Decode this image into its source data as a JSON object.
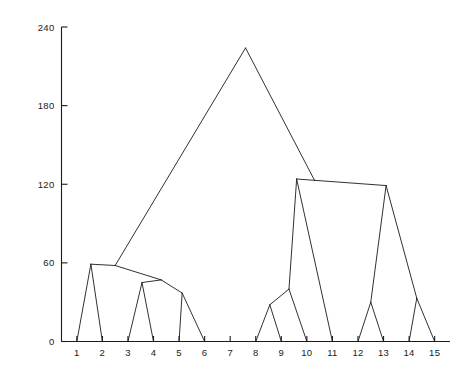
{
  "chart_data": {
    "type": "line",
    "title": "",
    "xlabel": "",
    "ylabel": "",
    "grid": false,
    "legend": "none",
    "plot_kind": "dendrogram",
    "orientation": "vertical-leaves-at-bottom",
    "xlim": [
      0.4,
      15.6
    ],
    "ylim": [
      0,
      240
    ],
    "y_ticks": [
      0,
      60,
      120,
      180,
      240
    ],
    "y_tick_labels": [
      "0",
      "60",
      "120",
      "180",
      "240"
    ],
    "x_ticks": [
      1,
      2,
      3,
      4,
      5,
      6,
      7,
      8,
      9,
      10,
      11,
      12,
      13,
      14,
      15
    ],
    "x_tick_labels": [
      "1",
      "2",
      "3",
      "4",
      "5",
      "6",
      "7",
      "8",
      "9",
      "10",
      "11",
      "12",
      "13",
      "14",
      "15"
    ],
    "leaves": [
      {
        "label": "1",
        "x": 1
      },
      {
        "label": "2",
        "x": 2
      },
      {
        "label": "3",
        "x": 3
      },
      {
        "label": "4",
        "x": 4
      },
      {
        "label": "5",
        "x": 5
      },
      {
        "label": "6",
        "x": 6
      },
      {
        "label": "7",
        "x": 7
      },
      {
        "label": "8",
        "x": 8
      },
      {
        "label": "9",
        "x": 9
      },
      {
        "label": "10",
        "x": 10
      },
      {
        "label": "11",
        "x": 11
      },
      {
        "label": "12",
        "x": 12
      },
      {
        "label": "13",
        "x": 13
      },
      {
        "label": "14",
        "x": 14
      },
      {
        "label": "15",
        "x": 15
      }
    ],
    "merges": [
      {
        "id": "n12",
        "x": 1.55,
        "height": 59,
        "children": [
          "1",
          "2"
        ]
      },
      {
        "id": "n34",
        "x": 3.55,
        "height": 45,
        "children": [
          "3",
          "4"
        ]
      },
      {
        "id": "n56",
        "x": 5.12,
        "height": 37,
        "children": [
          "5",
          "6"
        ]
      },
      {
        "id": "n3456",
        "x": 4.3,
        "height": 47,
        "children": [
          "n34",
          "n56"
        ]
      },
      {
        "id": "nL",
        "x": 2.5,
        "height": 58,
        "children": [
          "n12",
          "n3456"
        ]
      },
      {
        "id": "n89",
        "x": 8.55,
        "height": 28,
        "children": [
          "8",
          "9"
        ]
      },
      {
        "id": "n8910",
        "x": 9.3,
        "height": 40,
        "children": [
          "n89",
          "10"
        ]
      },
      {
        "id": "n1213",
        "x": 12.5,
        "height": 30,
        "children": [
          "12",
          "13"
        ]
      },
      {
        "id": "n1415",
        "x": 14.3,
        "height": 33,
        "children": [
          "14",
          "15"
        ]
      },
      {
        "id": "nR2",
        "x": 13.1,
        "height": 119,
        "children": [
          "n1213",
          "n1415"
        ]
      },
      {
        "id": "nR1",
        "x": 9.6,
        "height": 124,
        "children": [
          "n8910",
          "11"
        ]
      },
      {
        "id": "nRight",
        "x": 10.3,
        "height": 123,
        "children": [
          "nR1",
          "nR2"
        ]
      },
      {
        "id": "root",
        "x": 7.6,
        "height": 224,
        "children": [
          "nL",
          "nRight"
        ]
      }
    ],
    "root_height": 224,
    "n_leaves": 15,
    "max_merge_height": 224,
    "axis_color": "#1a1a1a",
    "line_color": "#1a1a1a",
    "background_color": "#ffffff"
  }
}
